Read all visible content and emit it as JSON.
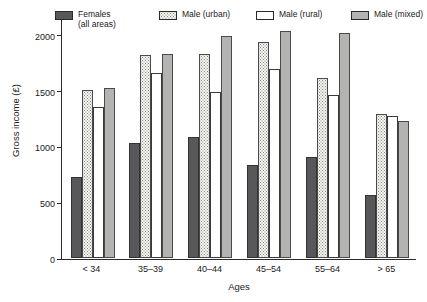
{
  "chart_data": {
    "type": "bar",
    "title": "",
    "xlabel": "Ages",
    "ylabel": "Gross income (£)",
    "categories": [
      "< 34",
      "35–39",
      "40–44",
      "45–54",
      "55–64",
      "> 65"
    ],
    "yticks": [
      0,
      500,
      1000,
      1500,
      2000
    ],
    "ylim": [
      0,
      2150
    ],
    "grid": false,
    "legend_position": "top",
    "series": [
      {
        "name": "Females\n(all areas)",
        "name_flat": "Females (all areas)",
        "fill": "solid-dark-gray",
        "color": "#58585a",
        "values": [
          720,
          1030,
          1080,
          830,
          900,
          560
        ]
      },
      {
        "name": "Male (urban)",
        "name_flat": "Male (urban)",
        "fill": "stippled-dots",
        "color": "#f4f4f1",
        "values": [
          1500,
          1820,
          1830,
          1930,
          1610,
          1290
        ]
      },
      {
        "name": "Male (rural)",
        "name_flat": "Male (rural)",
        "fill": "white",
        "color": "#ffffff",
        "values": [
          1350,
          1660,
          1490,
          1690,
          1460,
          1270
        ]
      },
      {
        "name": "Male (mixed)",
        "name_flat": "Male (mixed)",
        "fill": "solid-mid-gray",
        "color": "#b3b3b1",
        "values": [
          1520,
          1830,
          1990,
          2030,
          2010,
          1230
        ]
      }
    ]
  }
}
